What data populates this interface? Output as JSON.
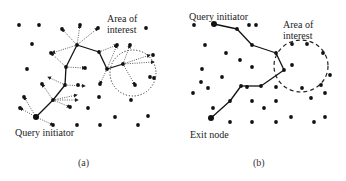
{
  "panels": [
    {
      "id": "a",
      "caption": "(a)",
      "labels": {
        "area_line1": "Area of",
        "area_line2": "interest",
        "initiator": "Query initiator"
      },
      "area_circle": {
        "cx": 133,
        "cy": 73,
        "r": 23,
        "style": "dotted"
      },
      "initiator_node": [
        36,
        117
      ],
      "path": [
        [
          36,
          117
        ],
        [
          53,
          100
        ],
        [
          65,
          85
        ],
        [
          66,
          67
        ],
        [
          77,
          45
        ],
        [
          99,
          52
        ],
        [
          107,
          69
        ],
        [
          123,
          64
        ]
      ],
      "dots": [
        [
          19,
          25
        ],
        [
          39,
          25
        ],
        [
          32,
          44
        ],
        [
          27,
          69
        ],
        [
          98,
          28
        ],
        [
          146,
          28
        ],
        [
          62,
          29
        ],
        [
          80,
          25
        ],
        [
          51,
          53
        ],
        [
          85,
          68
        ],
        [
          153,
          55
        ],
        [
          150,
          77
        ],
        [
          135,
          85
        ],
        [
          100,
          84
        ],
        [
          78,
          85
        ],
        [
          42,
          84
        ],
        [
          24,
          97
        ],
        [
          20,
          108
        ],
        [
          70,
          107
        ],
        [
          88,
          108
        ],
        [
          99,
          97
        ],
        [
          131,
          100
        ],
        [
          148,
          116
        ],
        [
          115,
          117
        ],
        [
          100,
          125
        ],
        [
          77,
          125
        ],
        [
          53,
          125
        ],
        [
          138,
          125
        ],
        [
          117,
          45
        ],
        [
          130,
          45
        ],
        [
          154,
          78
        ]
      ],
      "dotted_arrows": [
        [
          [
            36,
            117
          ],
          [
            20,
            108
          ]
        ],
        [
          [
            36,
            117
          ],
          [
            53,
            125
          ]
        ],
        [
          [
            36,
            117
          ],
          [
            24,
            97
          ]
        ],
        [
          [
            53,
            100
          ],
          [
            42,
            84
          ]
        ],
        [
          [
            53,
            100
          ],
          [
            70,
            107
          ]
        ],
        [
          [
            53,
            100
          ],
          [
            78,
            100
          ]
        ],
        [
          [
            53,
            100
          ],
          [
            77,
            95
          ]
        ],
        [
          [
            65,
            85
          ],
          [
            85,
            86
          ]
        ],
        [
          [
            65,
            85
          ],
          [
            48,
            77
          ]
        ],
        [
          [
            66,
            67
          ],
          [
            51,
            53
          ]
        ],
        [
          [
            66,
            67
          ],
          [
            85,
            68
          ]
        ],
        [
          [
            77,
            45
          ],
          [
            62,
            29
          ]
        ],
        [
          [
            77,
            45
          ],
          [
            80,
            25
          ]
        ],
        [
          [
            77,
            45
          ],
          [
            98,
            28
          ]
        ],
        [
          [
            77,
            45
          ],
          [
            52,
            53
          ]
        ],
        [
          [
            99,
            52
          ],
          [
            117,
            45
          ]
        ],
        [
          [
            107,
            69
          ],
          [
            100,
            84
          ]
        ],
        [
          [
            107,
            69
          ],
          [
            117,
            45
          ]
        ],
        [
          [
            123,
            64
          ],
          [
            130,
            45
          ]
        ],
        [
          [
            123,
            64
          ],
          [
            150,
            55
          ]
        ],
        [
          [
            123,
            64
          ],
          [
            135,
            85
          ]
        ],
        [
          [
            123,
            64
          ],
          [
            154,
            62
          ]
        ]
      ]
    },
    {
      "id": "b",
      "caption": "(b)",
      "labels": {
        "initiator": "Query initiator",
        "area_line1": "Area of",
        "area_line2": "interest",
        "exit": "Exit node"
      },
      "area_ellipse": {
        "cx": 301,
        "cy": 66,
        "rx": 27,
        "ry": 26,
        "style": "dashed"
      },
      "initiator_node": [
        214,
        24
      ],
      "exit_node": [
        211,
        118
      ],
      "path": [
        [
          214,
          24
        ],
        [
          237,
          29
        ],
        [
          252,
          45
        ],
        [
          276,
          53
        ],
        [
          284,
          70
        ],
        [
          261,
          86
        ],
        [
          241,
          86
        ],
        [
          230,
          101
        ],
        [
          211,
          118
        ]
      ],
      "dots": [
        [
          194,
          25
        ],
        [
          256,
          25
        ],
        [
          205,
          45
        ],
        [
          226,
          53
        ],
        [
          240,
          60
        ],
        [
          202,
          69
        ],
        [
          252,
          67
        ],
        [
          222,
          77
        ],
        [
          201,
          82
        ],
        [
          193,
          93
        ],
        [
          208,
          88
        ],
        [
          213,
          108
        ],
        [
          247,
          87
        ],
        [
          252,
          101
        ],
        [
          264,
          108
        ],
        [
          276,
          101
        ],
        [
          276,
          87
        ],
        [
          292,
          65
        ],
        [
          292,
          44
        ],
        [
          307,
          44
        ],
        [
          323,
          53
        ],
        [
          330,
          75
        ],
        [
          321,
          85
        ],
        [
          311,
          98
        ],
        [
          325,
          93
        ],
        [
          302,
          88
        ],
        [
          291,
          117
        ],
        [
          325,
          117
        ],
        [
          230,
          122
        ],
        [
          252,
          122
        ],
        [
          276,
          122
        ],
        [
          314,
          122
        ],
        [
          249,
          25
        ]
      ]
    }
  ]
}
